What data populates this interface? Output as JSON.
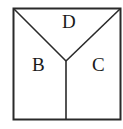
{
  "diagram": {
    "type": "partitioned-square",
    "stroke_color": "#2a2a2a",
    "background": "#ffffff",
    "regions": [
      {
        "id": "top",
        "label": "D"
      },
      {
        "id": "left",
        "label": "B"
      },
      {
        "id": "right",
        "label": "C"
      }
    ],
    "geometry": {
      "square": {
        "x1": 13,
        "y1": 8,
        "x2": 121,
        "y2": 120
      },
      "junction": {
        "x": 66,
        "y": 61
      }
    }
  }
}
